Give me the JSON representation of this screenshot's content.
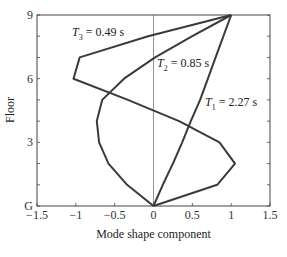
{
  "chart_data": {
    "type": "line",
    "title": "",
    "xlabel": "Mode shape component",
    "ylabel": "Floor",
    "xlim": [
      -1.5,
      1.5
    ],
    "ylim": [
      0,
      9
    ],
    "x_ticks": [
      "-1.5",
      "-1",
      "-0.5",
      "0",
      "0.5",
      "1",
      "1.5"
    ],
    "y_ticks": [
      "G",
      "3",
      "6",
      "9"
    ],
    "floors": [
      0,
      1,
      2,
      3,
      4,
      5,
      6,
      7,
      8,
      9
    ],
    "grid": false,
    "zero_line": true,
    "legend": "none (inline annotations)",
    "series": [
      {
        "name": "Mode 1",
        "annotation": {
          "symbol": "T",
          "subscript": "1",
          "text": " = 2.27 s"
        },
        "values": [
          0,
          0.12,
          0.25,
          0.37,
          0.48,
          0.6,
          0.7,
          0.8,
          0.9,
          1.0
        ]
      },
      {
        "name": "Mode 2",
        "annotation": {
          "symbol": "T",
          "subscript": "2",
          "text": " = 0.85 s"
        },
        "values": [
          0,
          -0.34,
          -0.58,
          -0.7,
          -0.73,
          -0.66,
          -0.38,
          0.02,
          0.5,
          1.0
        ]
      },
      {
        "name": "Mode 3",
        "annotation": {
          "symbol": "T",
          "subscript": "3",
          "text": " = 0.49 s"
        },
        "values": [
          0,
          0.82,
          1.05,
          0.85,
          0.33,
          -0.33,
          -1.03,
          -0.95,
          -0.07,
          1.0
        ]
      }
    ],
    "line_color": "#3a3a3a"
  }
}
